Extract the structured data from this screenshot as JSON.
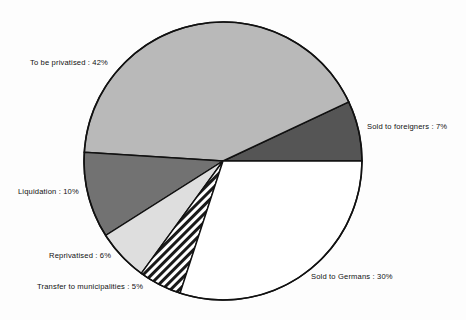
{
  "chart_data": {
    "type": "pie",
    "title": "",
    "subtitle": "",
    "xlabel": "",
    "ylabel": "",
    "legend_position": "none",
    "grid": false,
    "units": "percent",
    "total": 100,
    "start_angle_deg": 0,
    "direction": "counterclockwise",
    "categories": [
      "Sold to foreigners",
      "To be privatised",
      "Liquidation",
      "Reprivatised",
      "Transfer to municipalities",
      "Sold to Germans"
    ],
    "values": [
      7,
      42,
      10,
      6,
      5,
      30
    ],
    "slices": [
      {
        "name": "sold-to-foreigners",
        "label": "Sold to foreigners : 7%",
        "category": "Sold to foreigners",
        "value": 7,
        "fill": "#555555",
        "pattern": "solid",
        "label_x": 367,
        "label_y": 122,
        "label_align": "left"
      },
      {
        "name": "to-be-privatised",
        "label": "To be privatised : 42%",
        "category": "To be privatised",
        "value": 42,
        "fill": "#b9b9b9",
        "pattern": "solid",
        "label_x": 30,
        "label_y": 58,
        "label_align": "left"
      },
      {
        "name": "liquidation",
        "label": "Liquidation : 10%",
        "category": "Liquidation",
        "value": 10,
        "fill": "#727272",
        "pattern": "solid",
        "label_x": 18,
        "label_y": 187,
        "label_align": "left"
      },
      {
        "name": "reprivatised",
        "label": "Reprivatised : 6%",
        "category": "Reprivatised",
        "value": 6,
        "fill": "#dedede",
        "pattern": "solid",
        "label_x": 49,
        "label_y": 251,
        "label_align": "left"
      },
      {
        "name": "transfer-to-municipalities",
        "label": "Transfer to municipalities : 5%",
        "category": "Transfer to municipalities",
        "value": 5,
        "fill": "#ffffff",
        "pattern": "diagonal-hatch",
        "label_x": 37,
        "label_y": 282,
        "label_align": "left"
      },
      {
        "name": "sold-to-germans",
        "label": "Sold to Germans : 30%",
        "category": "Sold to Germans",
        "value": 30,
        "fill": "#ffffff",
        "pattern": "solid",
        "label_x": 311,
        "label_y": 272,
        "label_align": "left"
      }
    ],
    "geometry": {
      "center_x": 223,
      "center_y": 161,
      "radius": 139
    },
    "colors": {
      "outline": "#111111",
      "background": "#fdfdfd",
      "text": "#111111"
    }
  }
}
